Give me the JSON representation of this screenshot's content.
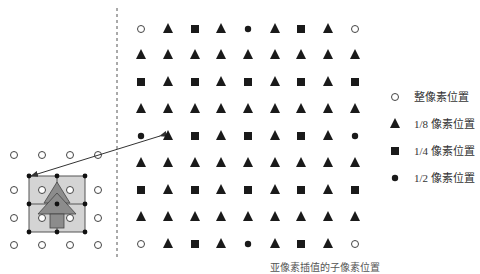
{
  "figure": {
    "caption": "亚像素插值的子像素位置",
    "colors": {
      "symbol": "#1a1a1a",
      "block_fill": "#cfcfcf",
      "tree_fill": "#8c8c8c",
      "line": "#333333"
    },
    "grid": {
      "columns_x": [
        141,
        168,
        195,
        221,
        248,
        275,
        301,
        328,
        355
      ],
      "rows_y": [
        29,
        55,
        82,
        109,
        136,
        163,
        190,
        217,
        244
      ],
      "pattern": [
        [
          "integer",
          "eighth",
          "quarter",
          "eighth",
          "half",
          "eighth",
          "quarter",
          "eighth",
          "integer"
        ],
        [
          "eighth",
          "eighth",
          "eighth",
          "eighth",
          "eighth",
          "eighth",
          "eighth",
          "eighth",
          "eighth"
        ],
        [
          "quarter",
          "eighth",
          "quarter",
          "eighth",
          "quarter",
          "eighth",
          "quarter",
          "eighth",
          "quarter"
        ],
        [
          "eighth",
          "eighth",
          "eighth",
          "eighth",
          "eighth",
          "eighth",
          "eighth",
          "eighth",
          "eighth"
        ],
        [
          "half",
          "eighth",
          "quarter",
          "eighth",
          "quarter",
          "eighth",
          "quarter",
          "eighth",
          "half"
        ],
        [
          "eighth",
          "eighth",
          "eighth",
          "eighth",
          "eighth",
          "eighth",
          "eighth",
          "eighth",
          "eighth"
        ],
        [
          "quarter",
          "eighth",
          "quarter",
          "eighth",
          "quarter",
          "eighth",
          "quarter",
          "eighth",
          "quarter"
        ],
        [
          "eighth",
          "eighth",
          "eighth",
          "eighth",
          "eighth",
          "eighth",
          "eighth",
          "eighth",
          "eighth"
        ],
        [
          "integer",
          "eighth",
          "quarter",
          "eighth",
          "half",
          "eighth",
          "quarter",
          "eighth",
          "integer"
        ]
      ]
    },
    "left_panel": {
      "circles_x": [
        14,
        42,
        70,
        98
      ],
      "circles_y": [
        155,
        190,
        218,
        245
      ]
    },
    "legend": [
      {
        "symbol": "integer",
        "label": "整像素位置"
      },
      {
        "symbol": "eighth",
        "label": "1/8 像素位置"
      },
      {
        "symbol": "quarter",
        "label": "1/4 像素位置"
      },
      {
        "symbol": "half",
        "label": "1/2 像素位置"
      }
    ]
  }
}
